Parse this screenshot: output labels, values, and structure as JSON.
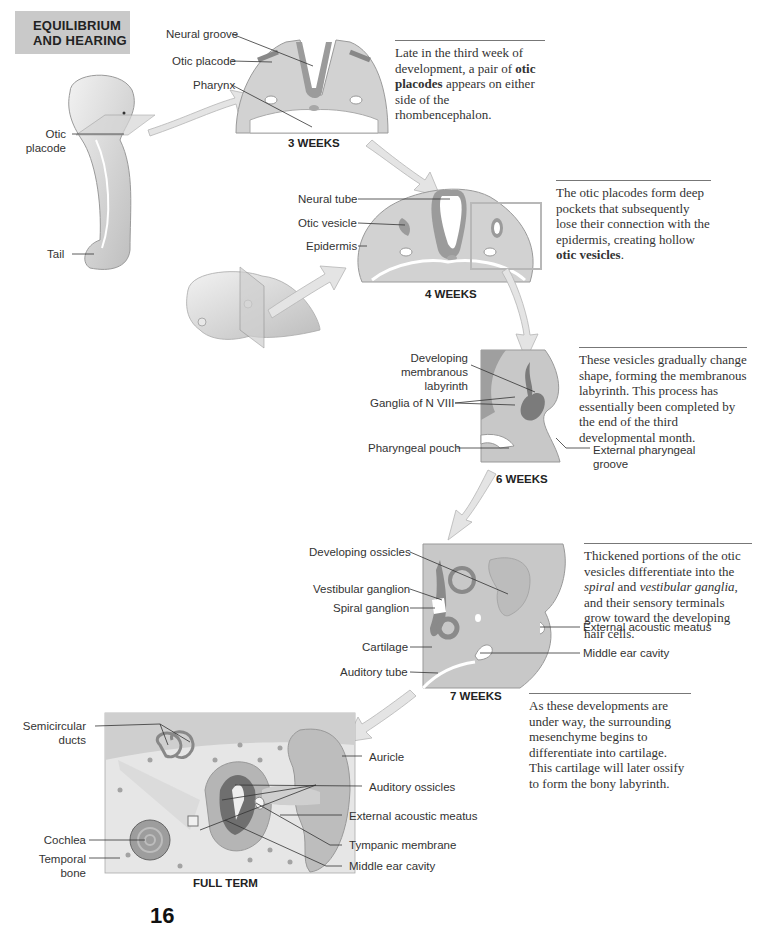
{
  "header": {
    "line1": "EQUILIBRIUM",
    "line2": "AND HEARING"
  },
  "stages": {
    "week3": {
      "title": "3 WEEKS",
      "labels": {
        "neural_groove": "Neural groove",
        "otic_placode": "Otic placode",
        "pharynx": "Pharynx"
      },
      "note": {
        "pre": "Late in the third week of development, a pair of ",
        "bold": "otic placodes",
        "post": " appears on either side of the rhombencephalon."
      }
    },
    "embryo": {
      "labels": {
        "otic_placode_1": "Otic",
        "otic_placode_2": "placode",
        "tail": "Tail"
      }
    },
    "week4": {
      "title": "4 WEEKS",
      "labels": {
        "neural_tube": "Neural tube",
        "otic_vesicle": "Otic vesicle",
        "epidermis": "Epidermis"
      },
      "note": {
        "pre": "The otic placodes form deep pockets that subsequently lose their connection with the epidermis, creating hollow ",
        "bold": "otic vesicles",
        "post": "."
      }
    },
    "week6": {
      "title": "6 WEEKS",
      "labels": {
        "developing_membranous_1": "Developing",
        "developing_membranous_2": "membranous",
        "developing_membranous_3": "labyrinth",
        "ganglia": "Ganglia of N VIII",
        "pharyngeal_pouch": "Pharyngeal pouch",
        "external_pharyngeal_1": "External pharyngeal",
        "external_pharyngeal_2": "groove"
      },
      "note": {
        "text": "These vesicles gradually change shape, forming the membranous labyrinth. This process has essentially been completed by the end of the third developmental month."
      }
    },
    "week7": {
      "title": "7 WEEKS",
      "labels": {
        "developing_ossicles": "Developing ossicles",
        "vestibular_ganglion": "Vestibular ganglion",
        "spiral_ganglion": "Spiral ganglion",
        "cartilage": "Cartilage",
        "auditory_tube": "Auditory tube",
        "external_acoustic_meatus": "External acoustic meatus",
        "middle_ear_cavity": "Middle ear cavity"
      },
      "note": {
        "pre": "Thickened portions of the otic vesicles differentiate into the ",
        "italic1": "spiral",
        "mid": " and ",
        "italic2": "vestibular ganglia",
        "post": ", and their sensory terminals grow toward the developing hair cells."
      },
      "note2": {
        "text": "As these developments are under way, the surrounding mesenchyme begins to differentiate into cartilage. This cartilage will later ossify to form the bony labyrinth."
      }
    },
    "full_term": {
      "title": "FULL TERM",
      "labels": {
        "semicircular_1": "Semicircular",
        "semicircular_2": "ducts",
        "cochlea": "Cochlea",
        "temporal_1": "Temporal",
        "temporal_2": "bone",
        "auricle": "Auricle",
        "auditory_ossicles": "Auditory ossicles",
        "external_acoustic_meatus": "External acoustic meatus",
        "tympanic_membrane": "Tympanic membrane",
        "middle_ear_cavity": "Middle ear cavity"
      }
    }
  },
  "page_number": "16",
  "colors": {
    "tissue_light": "#d8d8d8",
    "tissue_mid": "#bdbdbd",
    "tissue_dark": "#8f8f8f",
    "header_bg": "#c9c9c9",
    "arrow": "#e6e6e6"
  }
}
